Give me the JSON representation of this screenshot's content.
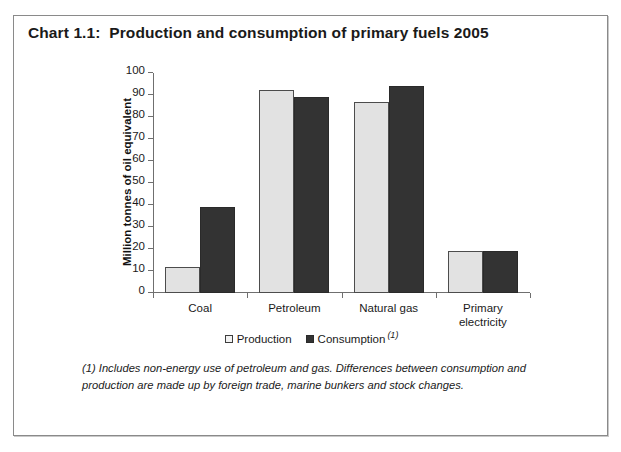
{
  "chart_title": "Chart 1.1:  Production and consumption of primary fuels 2005",
  "chart_data": {
    "type": "bar",
    "title": "Chart 1.1:  Production and consumption of primary fuels 2005",
    "xlabel": "",
    "ylabel": "Million tonnes of oil equivalent",
    "ylim": [
      0,
      100
    ],
    "ytick_step": 10,
    "yticks": [
      "0",
      "10",
      "20",
      "30",
      "40",
      "50",
      "60",
      "70",
      "80",
      "90",
      "100"
    ],
    "grid": false,
    "legend_position": "bottom-center",
    "categories": [
      "Coal",
      "Petroleum",
      "Natural gas",
      "Primary electricity"
    ],
    "category_lines": [
      [
        "Coal"
      ],
      [
        "Petroleum"
      ],
      [
        "Natural gas"
      ],
      [
        "Primary",
        "electricity"
      ]
    ],
    "series": [
      {
        "name": "Production",
        "color": "#e2e2e2",
        "values": [
          12,
          92.5,
          87,
          19
        ]
      },
      {
        "name": "Consumption",
        "color": "#333333",
        "footnote_marker": "(1)",
        "values": [
          39,
          89,
          94,
          19
        ]
      }
    ],
    "annotations": [
      "(1) Includes non-energy use of petroleum and gas. Differences between consumption and production are made up by foreign trade, marine bunkers and stock changes."
    ]
  },
  "legend": {
    "items": [
      {
        "label": "Production",
        "swatch": "light",
        "marker": ""
      },
      {
        "label": "Consumption",
        "swatch": "dark",
        "marker": "(1)"
      }
    ]
  },
  "footnote": {
    "text": "(1) Includes non-energy use of petroleum and gas. Differences between consumption and production are made up by foreign trade, marine bunkers and stock changes."
  }
}
